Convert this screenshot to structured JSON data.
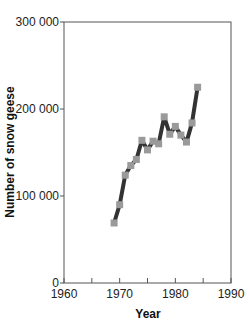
{
  "chart_data": {
    "type": "line",
    "title": "",
    "xlabel": "Year",
    "ylabel": "Number of snow geese",
    "xlim": [
      1960,
      1990
    ],
    "ylim": [
      0,
      300000
    ],
    "x_ticks": [
      1960,
      1965,
      1970,
      1975,
      1980,
      1985,
      1990
    ],
    "x_tick_labels": [
      "1960",
      "",
      "1970",
      "",
      "1980",
      "",
      "1990"
    ],
    "y_ticks": [
      0,
      100000,
      200000,
      300000
    ],
    "y_tick_labels": [
      "0",
      "100 000",
      "200 000",
      "300 000"
    ],
    "grid": false,
    "legend": null,
    "series": [
      {
        "name": "Snow geese",
        "line_color": "#333333",
        "marker_color": "#9a9a9a",
        "marker": "square",
        "x": [
          1969,
          1970,
          1971,
          1972,
          1973,
          1974,
          1975,
          1976,
          1977,
          1978,
          1979,
          1980,
          1981,
          1982,
          1983,
          1984
        ],
        "values": [
          69000,
          90000,
          124000,
          135000,
          142000,
          164000,
          153000,
          163000,
          160000,
          191000,
          171000,
          180000,
          170000,
          162000,
          184000,
          225000
        ]
      }
    ]
  }
}
